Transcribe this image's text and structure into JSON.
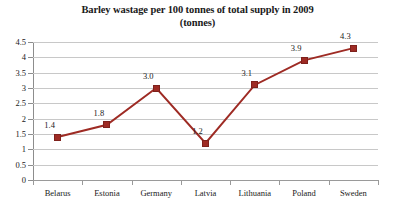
{
  "chart_data": {
    "type": "line",
    "title": "Barley wastage per 100 tonnes of total supply in 2009",
    "subtitle": "(tonnes)",
    "xlabel": "",
    "ylabel": "",
    "categories": [
      "Belarus",
      "Estonia",
      "Germany",
      "Latvia",
      "Lithuania",
      "Poland",
      "Sweden"
    ],
    "values": [
      1.4,
      1.8,
      3.0,
      1.2,
      3.1,
      3.9,
      4.3
    ],
    "point_labels": [
      "1.4",
      "1.8",
      "3.0",
      "1.2",
      "3.1",
      "3.9",
      "4.3"
    ],
    "ylim": [
      0,
      4.5
    ],
    "ytick_labels": [
      "4.5",
      "4",
      "3.5",
      "3",
      "2.5",
      "2",
      "1.5",
      "1",
      "0.5",
      "0"
    ],
    "ytick_values": [
      4.5,
      4,
      3.5,
      3,
      2.5,
      2,
      1.5,
      1,
      0.5,
      0
    ],
    "grid": true,
    "legend": "none",
    "series_color": "#9E2B24",
    "gridline_color": "#C8C8C8",
    "axis_color": "#8D8D8D",
    "background_color": "#FFFFFF",
    "marker": "square"
  }
}
